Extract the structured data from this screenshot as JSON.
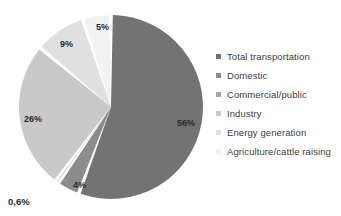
{
  "chart_data": {
    "type": "pie",
    "title": "",
    "labels": [
      "Total transportation",
      "Domestic",
      "Commercial/public",
      "Industry",
      "Energy generation",
      "Agriculture/cattle raising"
    ],
    "values": [
      56,
      4,
      0.6,
      26,
      9,
      5
    ],
    "value_labels": [
      "56%",
      "4%",
      "0,6%",
      "26%",
      "9%",
      "5%"
    ],
    "colors": [
      "#737373",
      "#8c8c8c",
      "#a6a6a6",
      "#c9c9c9",
      "#e0e0e0",
      "#f2f2f2"
    ],
    "slice_gap_color": "#ffffff",
    "start_angle_deg": 0,
    "direction": "clockwise",
    "legend_position": "right",
    "grid": false,
    "units": "percent"
  },
  "pie": {
    "labels_inside": [
      {
        "text": "56%",
        "x": 177,
        "y": 126
      },
      {
        "text": "4%",
        "x": 73,
        "y": 188
      },
      {
        "text": "26%",
        "x": 24,
        "y": 122
      },
      {
        "text": "9%",
        "x": 60,
        "y": 47
      },
      {
        "text": "5%",
        "x": 96,
        "y": 30
      }
    ],
    "labels_outside": [
      {
        "text": "0,6%",
        "x": 8,
        "y": 205
      }
    ]
  },
  "legend": {
    "items": [
      {
        "label": "Total transportation",
        "color": "#737373"
      },
      {
        "label": "Domestic",
        "color": "#8c8c8c"
      },
      {
        "label": "Commercial/public",
        "color": "#a6a6a6"
      },
      {
        "label": "Industry",
        "color": "#c9c9c9"
      },
      {
        "label": "Energy generation",
        "color": "#e0e0e0"
      },
      {
        "label": "Agriculture/cattle raising",
        "color": "#f2f2f2"
      }
    ]
  }
}
